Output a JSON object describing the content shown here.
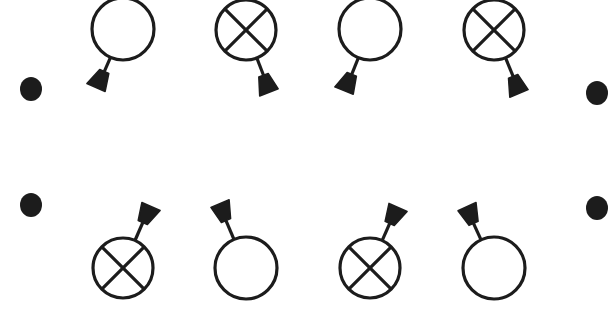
{
  "diagram": {
    "title": "",
    "colors": {
      "stroke": "#1c1c1c",
      "fill": "#1c1c1c",
      "background": "#ffffff"
    },
    "rows": [
      {
        "name": "top-row",
        "end_dots": [
          {
            "x": 31,
            "y": 89
          },
          {
            "x": 597,
            "y": 93
          }
        ],
        "symbols": [
          {
            "type": "open",
            "cx": 123,
            "cy": 29,
            "r": 31,
            "stalk_end": {
              "x": 97,
              "y": 88
            }
          },
          {
            "type": "cross",
            "cx": 246,
            "cy": 30,
            "r": 30,
            "stalk_end": {
              "x": 270,
              "y": 92
            }
          },
          {
            "type": "open",
            "cx": 370,
            "cy": 29,
            "r": 31,
            "stalk_end": {
              "x": 345,
              "y": 91
            }
          },
          {
            "type": "cross",
            "cx": 494,
            "cy": 30,
            "r": 30,
            "stalk_end": {
              "x": 520,
              "y": 93
            }
          }
        ]
      },
      {
        "name": "bottom-row",
        "end_dots": [
          {
            "x": 31,
            "y": 205
          },
          {
            "x": 597,
            "y": 208
          }
        ],
        "symbols": [
          {
            "type": "cross",
            "cx": 123,
            "cy": 268,
            "r": 30,
            "stalk_end": {
              "x": 150,
              "y": 206
            }
          },
          {
            "type": "open",
            "cx": 246,
            "cy": 268,
            "r": 31,
            "stalk_end": {
              "x": 219,
              "y": 204
            }
          },
          {
            "type": "cross",
            "cx": 370,
            "cy": 268,
            "r": 30,
            "stalk_end": {
              "x": 397,
              "y": 207
            }
          },
          {
            "type": "open",
            "cx": 494,
            "cy": 268,
            "r": 31,
            "stalk_end": {
              "x": 466,
              "y": 207
            }
          }
        ]
      }
    ]
  }
}
